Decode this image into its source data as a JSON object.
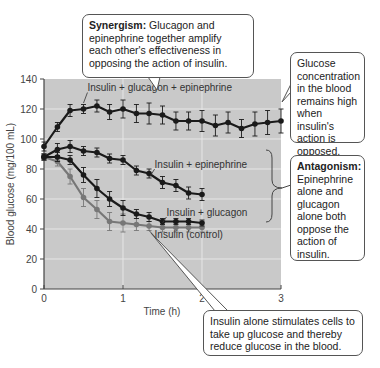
{
  "callouts": {
    "synergism": {
      "title": "Synergism:",
      "text": " Glucagon and epinephrine together amplify each other's effectiveness in opposing the action of insulin."
    },
    "glucose_high": {
      "text": "Glucose concentration in the blood remains high when insulin's action is opposed."
    },
    "antagonism": {
      "title": "Antagonism:",
      "text": " Epinephrine alone and glucagon alone both oppose the action of insulin."
    },
    "insulin_alone": {
      "text": "Insulin alone stimulates cells to take up glucose and thereby reduce glucose in the blood."
    }
  },
  "chart_data": {
    "type": "line",
    "title": "",
    "xlabel": "Time (h)",
    "ylabel": "Blood glucose (mg/100 mL)",
    "xlim": [
      0,
      3
    ],
    "ylim": [
      0,
      140
    ],
    "xticks": [
      0,
      1,
      2,
      3
    ],
    "yticks": [
      0,
      20,
      40,
      60,
      80,
      100,
      120,
      140
    ],
    "grid": true,
    "error_bars": true,
    "series": [
      {
        "name": "Insulin + glucagon + epinephrine",
        "color": "#1a1a1a",
        "x": [
          0,
          0.17,
          0.33,
          0.5,
          0.67,
          0.83,
          1.0,
          1.17,
          1.33,
          1.5,
          1.67,
          1.83,
          2.0,
          2.17,
          2.33,
          2.5,
          2.67,
          2.83,
          3.0
        ],
        "values": [
          95,
          108,
          119,
          120,
          122,
          118,
          120,
          117,
          117,
          116,
          112,
          112,
          112,
          109,
          111,
          107,
          110,
          111,
          112
        ],
        "err": [
          3,
          3,
          4,
          3,
          4,
          5,
          6,
          6,
          7,
          6,
          6,
          6,
          7,
          7,
          7,
          6,
          8,
          8,
          8
        ]
      },
      {
        "name": "Insulin + epinephrine",
        "color": "#1a1a1a",
        "x": [
          0,
          0.17,
          0.33,
          0.5,
          0.67,
          0.83,
          1.0,
          1.17,
          1.33,
          1.5,
          1.67,
          1.83,
          2.0
        ],
        "values": [
          88,
          93,
          95,
          92,
          91,
          87,
          86,
          79,
          77,
          71,
          69,
          64,
          63
        ],
        "err": [
          2,
          4,
          4,
          3,
          3,
          3,
          3,
          3,
          3,
          4,
          4,
          4,
          4
        ]
      },
      {
        "name": "Insulin + glucagon",
        "color": "#1a1a1a",
        "x": [
          0,
          0.17,
          0.33,
          0.5,
          0.67,
          0.83,
          1.0,
          1.17,
          1.33,
          1.5,
          1.67,
          1.83,
          2.0
        ],
        "values": [
          88,
          88,
          86,
          76,
          67,
          60,
          54,
          50,
          48,
          45,
          45,
          45,
          44
        ],
        "err": [
          2,
          3,
          3,
          5,
          6,
          5,
          5,
          3,
          3,
          2,
          2,
          2,
          2
        ]
      },
      {
        "name": "Insulin (control)",
        "color": "#777777",
        "x": [
          0,
          0.17,
          0.33,
          0.5,
          0.67,
          0.83,
          1.0,
          1.17,
          1.33,
          1.5,
          1.67,
          1.83,
          2.0
        ],
        "values": [
          88,
          85,
          75,
          61,
          53,
          45,
          44,
          43,
          42,
          41,
          41,
          41,
          41
        ],
        "err": [
          2,
          3,
          5,
          6,
          6,
          6,
          6,
          4,
          3,
          3,
          3,
          3,
          3
        ]
      }
    ],
    "series_labels": [
      {
        "text": "Insulin + glucagon + epinephrine",
        "x": 0.55,
        "y": 132
      },
      {
        "text": "Insulin + epinephrine",
        "x": 1.4,
        "y": 81
      },
      {
        "text": "Insulin + glucagon",
        "x": 1.55,
        "y": 49
      },
      {
        "text": "Insulin (control)",
        "x": 1.4,
        "y": 34
      }
    ]
  }
}
